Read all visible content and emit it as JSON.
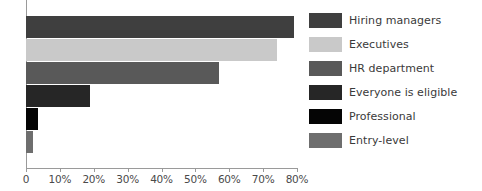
{
  "chart_data": {
    "type": "bar",
    "orientation": "horizontal",
    "title": "",
    "subtitle": "",
    "xlabel": "",
    "ylabel": "",
    "xlim": [
      0,
      80
    ],
    "grid": false,
    "legend_position": "right",
    "categories": [
      "Hiring managers",
      "Executives",
      "HR department",
      "Everyone is eligible",
      "Professional",
      "Entry-level"
    ],
    "values": [
      79,
      74,
      57,
      19,
      3.5,
      2
    ],
    "tick_labels": [
      "0",
      "10%",
      "20%",
      "30%",
      "40%",
      "50%",
      "60%",
      "70%",
      "80%"
    ],
    "tick_values": [
      0,
      10,
      20,
      30,
      40,
      50,
      60,
      70,
      80
    ],
    "series": [
      {
        "name": "Share",
        "values": [
          79,
          74,
          57,
          19,
          3.5,
          2
        ]
      }
    ],
    "colors": [
      "#3f3f3f",
      "#c9c9c9",
      "#595959",
      "#262626",
      "#050505",
      "#6e6e6e"
    ],
    "axis_color": "#9a9a9a",
    "tick_label_color": "#4a4a4a",
    "legend_text_color": "#3a3a3a",
    "background": "#ffffff"
  },
  "legend": {
    "items": [
      {
        "label": "Hiring managers",
        "color": "#3f3f3f"
      },
      {
        "label": "Executives",
        "color": "#c9c9c9"
      },
      {
        "label": "HR department",
        "color": "#595959"
      },
      {
        "label": "Everyone is eligible",
        "color": "#262626"
      },
      {
        "label": "Professional",
        "color": "#050505"
      },
      {
        "label": "Entry-level",
        "color": "#6e6e6e"
      }
    ]
  },
  "axis": {
    "ticks": [
      {
        "label": "0",
        "value": 0
      },
      {
        "label": "10%",
        "value": 10
      },
      {
        "label": "20%",
        "value": 20
      },
      {
        "label": "30%",
        "value": 30
      },
      {
        "label": "40%",
        "value": 40
      },
      {
        "label": "50%",
        "value": 50
      },
      {
        "label": "60%",
        "value": 60
      },
      {
        "label": "70%",
        "value": 70
      },
      {
        "label": "80%",
        "value": 80
      }
    ]
  }
}
